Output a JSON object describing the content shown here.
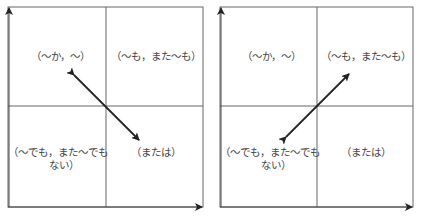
{
  "diagrams": [
    {
      "name": "left-diagram",
      "quadrants": {
        "top_left": "（〜か，〜）",
        "top_right": "（〜も，また〜も）",
        "bottom_left_line1": "（〜でも，また〜でも",
        "bottom_left_line2": "ない）",
        "bottom_right": "（または）"
      },
      "arrow": "double-headed, top-left to bottom-right"
    },
    {
      "name": "right-diagram",
      "quadrants": {
        "top_left": "（〜か，〜）",
        "top_right": "（〜も，また〜も）",
        "bottom_left_line1": "（〜でも，また〜でも",
        "bottom_left_line2": "ない）",
        "bottom_right": "（または）"
      },
      "arrow": "double-headed, bottom-left to top-right"
    }
  ],
  "colors": {
    "line": "#555555",
    "arrow": "#222222",
    "text": "#444444"
  }
}
